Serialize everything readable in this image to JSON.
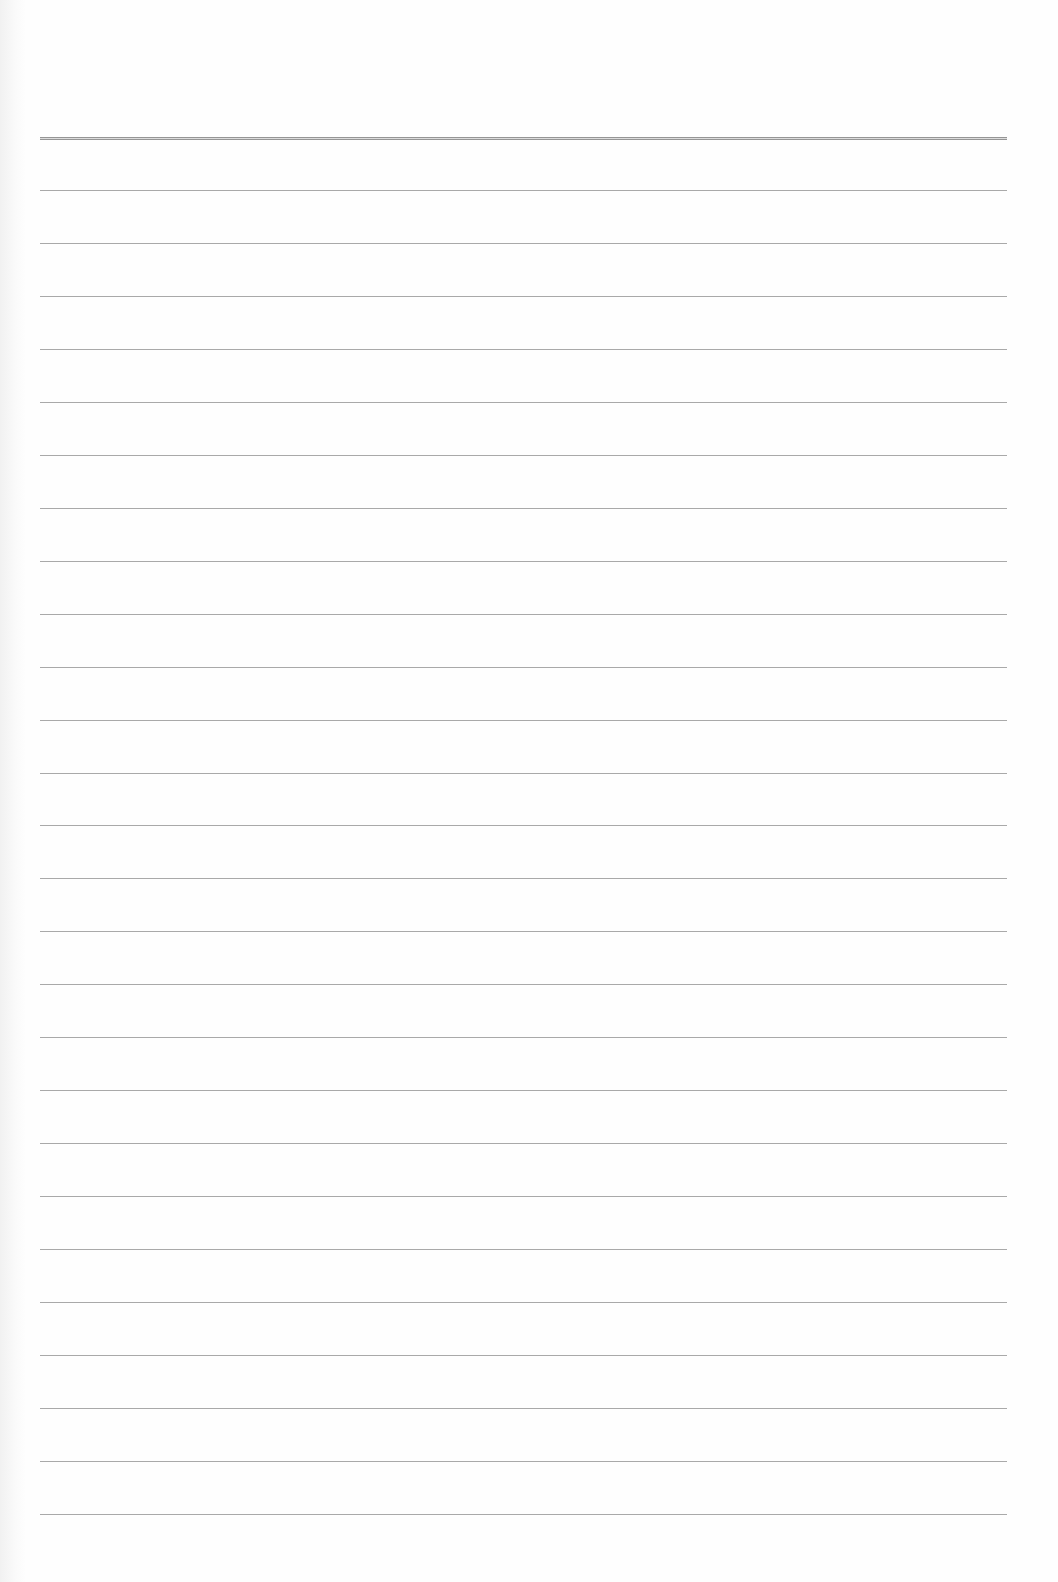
{
  "page": {
    "type": "ruled-paper",
    "background_color": "#fefefe",
    "rule_color": "#9a9a9a",
    "rules": {
      "count": 27,
      "first_y": 137,
      "spacing": 52.96,
      "left_x": 40,
      "right_x": 1007,
      "first_rule_style": "double"
    },
    "text_content": []
  }
}
